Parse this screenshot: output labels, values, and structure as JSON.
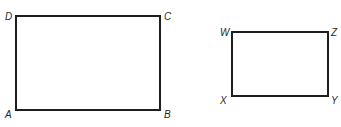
{
  "figure": {
    "rectangles": [
      {
        "name": "ABCD",
        "vertices": {
          "top_left": "D",
          "top_right": "C",
          "bottom_left": "A",
          "bottom_right": "B"
        },
        "x": 16,
        "y": 16,
        "width": 144,
        "height": 94
      },
      {
        "name": "WXYZ",
        "vertices": {
          "top_left": "W",
          "top_right": "Z",
          "bottom_left": "X",
          "bottom_right": "Y"
        },
        "x": 232,
        "y": 32,
        "width": 96,
        "height": 64
      }
    ],
    "colors": {
      "stroke": "#1f1f1f",
      "label": "#2a2a2a",
      "background": "#ffffff"
    }
  }
}
